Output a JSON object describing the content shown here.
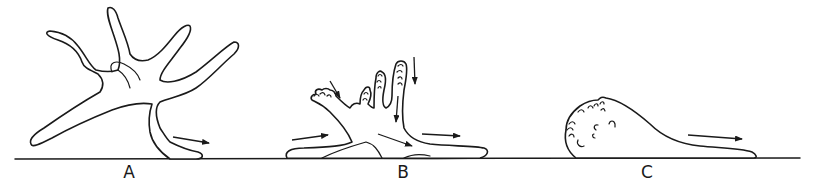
{
  "figure": {
    "panels": [
      {
        "label": "A",
        "description": "Cell with multiple long extended pseudopodia; motion to the right"
      },
      {
        "label": "B",
        "description": "Cell spreading on substrate with ruffled-tip processes; arrows indicate flow"
      },
      {
        "label": "C",
        "description": "Rounded cell with blebbed/ruffled front and trailing tail; motion to the right"
      }
    ],
    "colors": {
      "ink": "#1a1a1a",
      "background": "#ffffff"
    }
  }
}
